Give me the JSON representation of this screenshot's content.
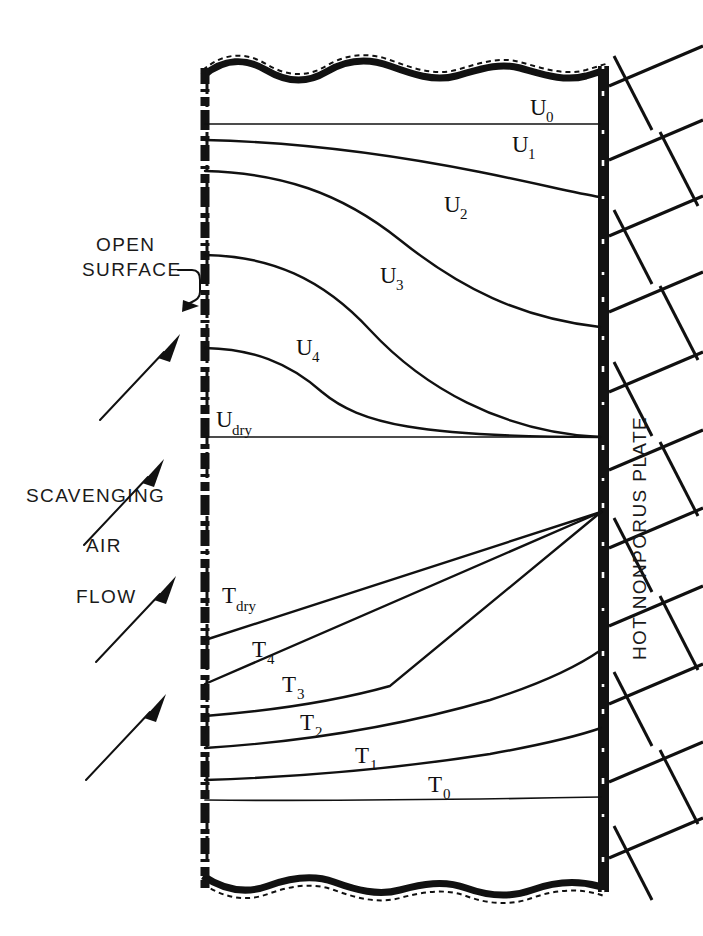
{
  "figure": {
    "type": "technical-diagram"
  },
  "annotations": {
    "open_surface_line1": "OPEN",
    "open_surface_line2": "SURFACE",
    "scavenging": "SCAVENGING",
    "air": "AIR",
    "flow": "FLOW",
    "plate_label": "HOT  NONPORUS  PLATE"
  },
  "velocity_profiles": {
    "group_label": "U",
    "curves": [
      {
        "id": "u0",
        "base": "U",
        "sub": "0",
        "label": "U0"
      },
      {
        "id": "u1",
        "base": "U",
        "sub": "1",
        "label": "U1"
      },
      {
        "id": "u2",
        "base": "U",
        "sub": "2",
        "label": "U2"
      },
      {
        "id": "u3",
        "base": "U",
        "sub": "3",
        "label": "U3"
      },
      {
        "id": "u4",
        "base": "U",
        "sub": "4",
        "label": "U4"
      },
      {
        "id": "udry",
        "base": "U",
        "sub": "dry",
        "label": "Udry"
      }
    ]
  },
  "temperature_profiles": {
    "group_label": "T",
    "curves": [
      {
        "id": "tdry",
        "base": "T",
        "sub": "dry",
        "label": "Tdry"
      },
      {
        "id": "t4",
        "base": "T",
        "sub": "4",
        "label": "T4"
      },
      {
        "id": "t3",
        "base": "T",
        "sub": "3",
        "label": "T3"
      },
      {
        "id": "t2",
        "base": "T",
        "sub": "2",
        "label": "T2"
      },
      {
        "id": "t1",
        "base": "T",
        "sub": "1",
        "label": "T1"
      },
      {
        "id": "t0",
        "base": "T",
        "sub": "0",
        "label": "T0"
      }
    ]
  },
  "colors": {
    "ink": "#111111",
    "background": "#ffffff"
  }
}
